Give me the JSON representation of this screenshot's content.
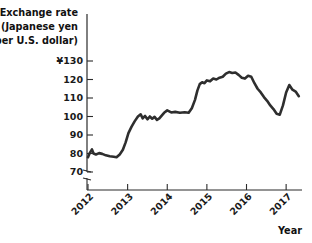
{
  "chart_data": {
    "type": "line",
    "title": "",
    "ylabel_lines": [
      "Exchange rate",
      "(Japanese yen",
      "per U.S. dollar)"
    ],
    "ylabel": "Exchange rate (Japanese yen per U.S. dollar)",
    "xlabel": "Year",
    "currency_symbol": "¥",
    "ytick_labels": [
      "¥130",
      "120",
      "110",
      "100",
      "90",
      "80",
      "70"
    ],
    "ytick_values": [
      130,
      120,
      110,
      100,
      90,
      80,
      70
    ],
    "xtick_labels": [
      "2012",
      "2013",
      "2014",
      "2015",
      "2016",
      "2017"
    ],
    "xtick_values": [
      2012,
      2013,
      2014,
      2015,
      2016,
      2017
    ],
    "ylim": [
      65,
      132
    ],
    "xlim": [
      2012.0,
      2017.35
    ],
    "axis_break": true,
    "grid": false,
    "legend": false,
    "line_color": "#2e2e2e",
    "series": [
      {
        "name": "Japanese yen per U.S. dollar",
        "x": [
          2012.0,
          2012.05,
          2012.1,
          2012.14,
          2012.2,
          2012.28,
          2012.36,
          2012.45,
          2012.55,
          2012.65,
          2012.72,
          2012.8,
          2012.88,
          2012.95,
          2013.02,
          2013.1,
          2013.18,
          2013.26,
          2013.33,
          2013.38,
          2013.44,
          2013.5,
          2013.56,
          2013.62,
          2013.68,
          2013.74,
          2013.8,
          2013.86,
          2013.92,
          2014.0,
          2014.1,
          2014.2,
          2014.32,
          2014.44,
          2014.54,
          2014.62,
          2014.7,
          2014.76,
          2014.82,
          2014.88,
          2014.94,
          2015.0,
          2015.08,
          2015.16,
          2015.24,
          2015.32,
          2015.4,
          2015.48,
          2015.56,
          2015.64,
          2015.72,
          2015.8,
          2015.88,
          2015.96,
          2016.04,
          2016.12,
          2016.2,
          2016.28,
          2016.36,
          2016.44,
          2016.52,
          2016.6,
          2016.68,
          2016.76,
          2016.84,
          2016.92,
          2017.0,
          2017.08,
          2017.16,
          2017.24,
          2017.32
        ],
        "y": [
          78.0,
          80.5,
          82.2,
          80.0,
          79.5,
          80.2,
          79.8,
          79.0,
          78.5,
          78.2,
          78.0,
          79.5,
          82.0,
          86.0,
          91.0,
          94.5,
          97.5,
          100.0,
          101.2,
          99.0,
          100.3,
          98.5,
          100.0,
          98.8,
          99.8,
          98.2,
          99.0,
          100.5,
          102.0,
          103.3,
          102.2,
          102.5,
          102.0,
          102.3,
          102.0,
          104.5,
          109.0,
          114.0,
          117.5,
          118.5,
          118.0,
          119.5,
          119.0,
          120.5,
          120.0,
          121.0,
          121.5,
          123.2,
          124.0,
          123.5,
          123.8,
          122.5,
          121.0,
          120.5,
          122.0,
          121.5,
          118.0,
          115.0,
          113.0,
          110.5,
          108.5,
          106.0,
          104.0,
          101.5,
          101.0,
          106.0,
          113.0,
          117.0,
          114.5,
          113.5,
          111.0
        ]
      }
    ],
    "annotations": []
  }
}
